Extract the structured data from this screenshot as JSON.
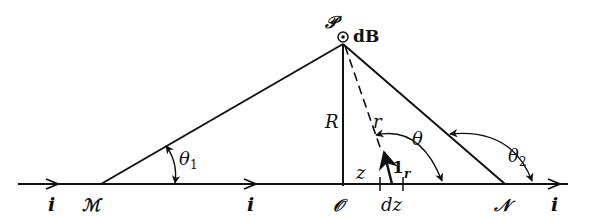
{
  "figure": {
    "type": "magnetic field of a finite straight current-carrying wire (Biot-Savart geometry)",
    "labels": {
      "point_P": "𝒫",
      "field_element": "dB",
      "point_M": "ℳ",
      "point_O": "𝒪",
      "point_N": "𝒩",
      "current_left": "i",
      "current_mid": "i",
      "current_right": "i",
      "distance_R": "R",
      "distance_r": "r",
      "position_z": "z",
      "element_dz": "dz",
      "unit_vector_main": "1",
      "unit_vector_sub": "r",
      "angle_theta": "θ",
      "angle_theta1_main": "θ",
      "angle_theta1_sub": "1",
      "angle_theta2_main": "θ",
      "angle_theta2_sub": "2"
    },
    "colors": {
      "stroke": "#111111",
      "background": "#ffffff"
    },
    "icons": {
      "dB_direction": "circled-dot-out-of-page-icon"
    }
  }
}
